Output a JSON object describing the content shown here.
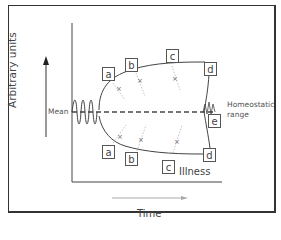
{
  "diagram": {
    "y_axis_label": "Arbitrary units",
    "x_axis_label": "Time",
    "mean_label": "Mean",
    "homeostatic_label_line1": "Homeostatic",
    "homeostatic_label_line2": "range",
    "illness_label": "Illness",
    "upper_boxes": [
      "a",
      "b",
      "c",
      "d"
    ],
    "lower_boxes": [
      "a",
      "b",
      "c",
      "d"
    ],
    "right_box": "e",
    "colors": {
      "line": "#444444",
      "arrow": "#999999",
      "frame": "#333333"
    }
  }
}
